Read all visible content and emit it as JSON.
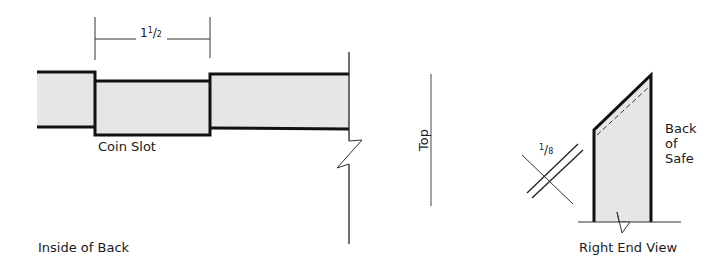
{
  "diagram": {
    "colors": {
      "fill": "#e6e6e6",
      "stroke": "#111111"
    },
    "inside_of_back": {
      "caption": "Inside of Back",
      "slot_label": "Coin Slot",
      "dimension": {
        "whole": "1",
        "num": "1",
        "den": "2"
      }
    },
    "top": {
      "label": "Top"
    },
    "right_end_view": {
      "caption": "Right End View",
      "side_label_1": "Back",
      "side_label_2": "of",
      "side_label_3": "Safe",
      "thickness": {
        "num": "1",
        "den": "8"
      }
    }
  }
}
